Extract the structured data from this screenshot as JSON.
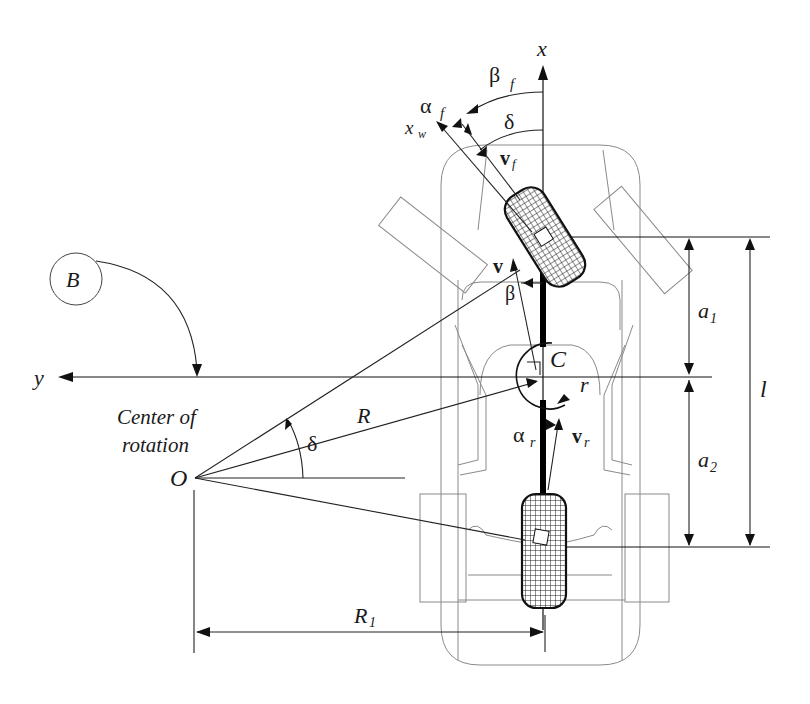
{
  "diagram": {
    "labels": {
      "x_axis": "x",
      "y_axis": "y",
      "xw": "x",
      "xw_sub": "w",
      "beta_f": "β",
      "beta_f_sub": "f",
      "alpha_f": "α",
      "alpha_f_sub": "f",
      "delta_front": "δ",
      "v_f": "v",
      "v_f_sub": "f",
      "v": "v",
      "beta": "β",
      "C": "C",
      "r": "r",
      "alpha_r": "α",
      "alpha_r_sub": "r",
      "v_r": "v",
      "v_r_sub": "r",
      "B": "B",
      "center_of_rotation_line1": "Center of",
      "center_of_rotation_line2": "rotation",
      "O": "O",
      "R": "R",
      "delta_O": "δ",
      "R1": "R",
      "R1_sub": "1",
      "a1": "a",
      "a1_sub": "1",
      "a2": "a",
      "a2_sub": "2",
      "l": "l"
    },
    "colors": {
      "ink": "#111111",
      "outline": "#8a8a8a",
      "background": "#ffffff"
    }
  }
}
